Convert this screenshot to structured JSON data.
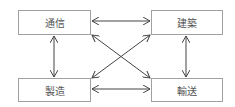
{
  "diagram": {
    "type": "relationship-graph",
    "nodes": [
      {
        "id": "tsushin",
        "label": "通信",
        "x": 18,
        "y": 10,
        "w": 73,
        "h": 25
      },
      {
        "id": "kenchiku",
        "label": "建築",
        "x": 151,
        "y": 10,
        "w": 72,
        "h": 25
      },
      {
        "id": "seizo",
        "label": "製造",
        "x": 18,
        "y": 78,
        "w": 73,
        "h": 24
      },
      {
        "id": "yuso",
        "label": "輸送",
        "x": 151,
        "y": 78,
        "w": 72,
        "h": 24
      }
    ],
    "edges": [
      {
        "from": "tsushin",
        "to": "kenchiku",
        "bidirectional": true
      },
      {
        "from": "seizo",
        "to": "yuso",
        "bidirectional": true
      },
      {
        "from": "tsushin",
        "to": "seizo",
        "bidirectional": true
      },
      {
        "from": "kenchiku",
        "to": "yuso",
        "bidirectional": true
      },
      {
        "from": "tsushin",
        "to": "yuso",
        "bidirectional": true
      },
      {
        "from": "kenchiku",
        "to": "seizo",
        "bidirectional": true
      }
    ],
    "colors": {
      "edge": "#444444",
      "border": "#a0a0a0",
      "text": "#555555"
    }
  }
}
